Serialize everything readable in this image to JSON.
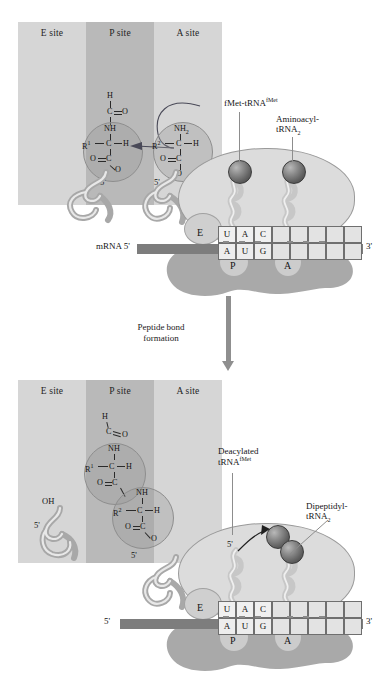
{
  "figure": {
    "type": "process-diagram",
    "transition": {
      "label_line1": "Peptide bond",
      "label_line2": "formation"
    }
  },
  "sites": {
    "e": "E site",
    "p": "P site",
    "a": "A site"
  },
  "ribosome_sites": {
    "e": "E",
    "p": "P",
    "a": "A"
  },
  "mrna": {
    "top_left_label": "mRNA 5'",
    "bottom_left_label": "5'",
    "right_label": "3'",
    "codons": [
      "A",
      "U",
      "G",
      "",
      "",
      "",
      "",
      "",
      ""
    ],
    "anticodon": [
      "U",
      "A",
      "C",
      "",
      "",
      "",
      "",
      "",
      ""
    ]
  },
  "panel_top": {
    "labels": {
      "fmet_trna": {
        "main": "fMet-tRNA",
        "sup": "fMet"
      },
      "aminoacyl": {
        "line1": "Aminoacyl-",
        "line2": "tRNA",
        "sub": "2"
      }
    },
    "p_site_chem": {
      "formyl_h": "H",
      "formyl_c": "C",
      "formyl_o": "O",
      "amide": "NH",
      "r_group": "R",
      "r_sup": "1",
      "alpha_c": "C",
      "alpha_h": "H",
      "ester_o_left": "O",
      "ester_c": "C",
      "ester_o_down": "O",
      "five_prime": "5'"
    },
    "a_site_chem": {
      "amine": "NH",
      "amine_sub": "2",
      "r_group": "R",
      "r_sup": "2",
      "alpha_c": "C",
      "alpha_h": "H",
      "ester_o_left": "O",
      "ester_c": "C",
      "ester_o_down": "O",
      "five_prime": "5'"
    }
  },
  "panel_bottom": {
    "labels": {
      "deacylated": {
        "line1": "Deacylated",
        "line2": "tRNA",
        "sup": "fMet"
      },
      "dipeptidyl": {
        "line1": "Dipeptidyl-",
        "line2": "tRNA",
        "sub": "2"
      }
    },
    "e_site_chem": {
      "hydroxyl": "OH",
      "five_prime": "5'"
    },
    "dipeptide_chem": {
      "formyl_h": "H",
      "formyl_c": "C",
      "formyl_o": "O",
      "amide1": "NH",
      "r1": "R",
      "r1_sup": "1",
      "alpha_c1": "C",
      "alpha_h1": "H",
      "carbonyl_o1": "O",
      "carbonyl_c1": "C",
      "amide2": "NH",
      "r2": "R",
      "r2_sup": "2",
      "alpha_c2": "C",
      "alpha_h2": "H",
      "ester_o2": "O",
      "ester_c2": "C",
      "ester_o_down2": "O",
      "five_prime": "5'"
    },
    "trna_five_prime_left": "5'",
    "trna_five_prime_right": "5'"
  },
  "colors": {
    "e_site_bg": "#d6d6d6",
    "p_site_bg": "#b9b9b9",
    "a_site_bg": "#d6d6d6",
    "large_subunit": "#dcdcdc",
    "small_subunit": "#a9a9a9",
    "mrna_bar": "#7d7d7d",
    "amino_acid_sphere": "#6b6b6b",
    "arrow": "#8f8f8f"
  }
}
